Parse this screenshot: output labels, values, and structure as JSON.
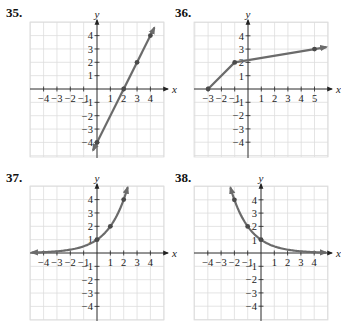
{
  "chart_data": [
    {
      "id": "35",
      "label": "35.",
      "type": "line",
      "title": "",
      "xlabel": "x",
      "ylabel": "y",
      "xlim": [
        -5,
        5
      ],
      "ylim": [
        -5,
        5
      ],
      "grid": true,
      "x_ticks": [
        -4,
        -3,
        -2,
        -1,
        1,
        2,
        3,
        4
      ],
      "y_ticks": [
        -4,
        -3,
        -2,
        -1,
        1,
        2,
        3,
        4
      ],
      "tick_labels_x": [
        "−4",
        "−3",
        "−2",
        "−1",
        "1",
        "2",
        "3",
        "4"
      ],
      "tick_labels_y": [
        "−4",
        "−3",
        "−2",
        "−1",
        "1",
        "2",
        "3",
        "4"
      ],
      "curve": "linear",
      "series": [
        {
          "name": "y = 2x − 4",
          "x": [
            -0.3,
            4.3
          ],
          "y": [
            -4.6,
            4.6
          ]
        }
      ],
      "points": [
        [
          0,
          -4
        ],
        [
          2,
          0
        ],
        [
          3,
          2
        ],
        [
          4,
          4
        ]
      ],
      "arrows": "both"
    },
    {
      "id": "36",
      "label": "36.",
      "type": "line",
      "title": "",
      "xlabel": "x",
      "ylabel": "y",
      "xlim": [
        -4,
        6
      ],
      "ylim": [
        -5,
        5
      ],
      "grid": true,
      "x_ticks": [
        -3,
        -2,
        -1,
        1,
        2,
        3,
        4,
        5
      ],
      "y_ticks": [
        -4,
        -3,
        -2,
        -1,
        1,
        2,
        3,
        4
      ],
      "tick_labels_x": [
        "−3",
        "−2",
        "−1",
        "1",
        "2",
        "3",
        "4",
        "5"
      ],
      "tick_labels_y": [
        "−4",
        "−3",
        "−2",
        "−1",
        "1",
        "2",
        "3",
        "4"
      ],
      "curve": "polyline",
      "series": [
        {
          "name": "path",
          "x": [
            -3,
            -1,
            5,
            5.9
          ],
          "y": [
            0,
            2,
            3,
            3.15
          ]
        }
      ],
      "points": [
        [
          -3,
          0
        ],
        [
          -1,
          2
        ],
        [
          5,
          3
        ]
      ],
      "arrows": "end"
    },
    {
      "id": "37",
      "label": "37.",
      "type": "line",
      "title": "",
      "xlabel": "x",
      "ylabel": "y",
      "xlim": [
        -5,
        5
      ],
      "ylim": [
        -5,
        5
      ],
      "grid": true,
      "x_ticks": [
        -4,
        -3,
        -2,
        -1,
        1,
        2,
        3,
        4
      ],
      "y_ticks": [
        -4,
        -3,
        -2,
        -1,
        1,
        2,
        3,
        4
      ],
      "tick_labels_x": [
        "−4",
        "−3",
        "−2",
        "−1",
        "1",
        "2",
        "3",
        "4"
      ],
      "tick_labels_y": [
        "−4",
        "−3",
        "−2",
        "−1",
        "1",
        "2",
        "3",
        "4"
      ],
      "curve": "exp",
      "series": [
        {
          "name": "y = 2^x",
          "base": 2,
          "x_range": [
            -4.9,
            2.3
          ]
        }
      ],
      "points": [
        [
          0,
          1
        ],
        [
          1,
          2
        ],
        [
          2,
          4
        ]
      ],
      "arrows": "both"
    },
    {
      "id": "38",
      "label": "38.",
      "type": "line",
      "title": "",
      "xlabel": "x",
      "ylabel": "y",
      "xlim": [
        -5,
        5
      ],
      "ylim": [
        -5,
        5
      ],
      "grid": true,
      "x_ticks": [
        -4,
        -3,
        -2,
        -1,
        1,
        2,
        3,
        4
      ],
      "y_ticks": [
        -4,
        -3,
        -2,
        -1,
        1,
        2,
        3,
        4
      ],
      "tick_labels_x": [
        "−4",
        "−3",
        "−2",
        "−1",
        "1",
        "2",
        "3",
        "4"
      ],
      "tick_labels_y": [
        "−4",
        "−3",
        "−2",
        "−1",
        "1",
        "2",
        "3",
        "4"
      ],
      "curve": "exp",
      "series": [
        {
          "name": "y = (1/2)^x",
          "base": 0.5,
          "x_range": [
            -2.3,
            4.9
          ]
        }
      ],
      "points": [
        [
          -2,
          4
        ],
        [
          -1,
          2
        ],
        [
          0,
          1
        ]
      ],
      "arrows": "both"
    }
  ],
  "layout": [
    {
      "id": "35",
      "label_pos": [
        6,
        18
      ],
      "origin": [
        97,
        89
      ],
      "unit": 13.35,
      "grid_box": [
        30,
        22,
        164,
        157
      ]
    },
    {
      "id": "36",
      "label_pos": [
        175,
        18
      ],
      "origin": [
        248,
        89
      ],
      "unit": 13.3,
      "grid_box": [
        194,
        22,
        328,
        157
      ]
    },
    {
      "id": "37",
      "label_pos": [
        6,
        183
      ],
      "origin": [
        97,
        253
      ],
      "unit": 13.35,
      "grid_box": [
        30,
        186,
        164,
        320
      ]
    },
    {
      "id": "38",
      "label_pos": [
        175,
        183
      ],
      "origin": [
        261,
        253
      ],
      "unit": 13.3,
      "grid_box": [
        194,
        186,
        328,
        320
      ]
    }
  ],
  "colors": {
    "grid": "#dddddd",
    "axis": "#222222",
    "curve": "#6b6b6b",
    "point": "#4a4a4a"
  }
}
